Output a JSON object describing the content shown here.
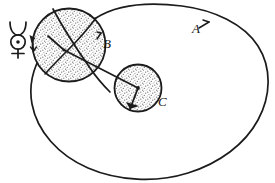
{
  "figure": {
    "background_color": "#ffffff",
    "ink_color": "#1b1b1b",
    "stipple_color": "#8a8a8a",
    "width": 275,
    "height": 183,
    "symbols": [
      {
        "id": "mercury-symbol",
        "name": "mercury-astronomical-symbol",
        "glyph": "☿",
        "x": 16,
        "y": 33,
        "description": "crescent horns above a dotted circle above a cross"
      }
    ],
    "labels": [
      {
        "id": "label-a",
        "text": "A",
        "x": 192,
        "y": 33,
        "target": "outer-oval-orbit"
      },
      {
        "id": "label-b",
        "text": "B",
        "x": 103,
        "y": 48,
        "target": "large-stippled-circle"
      },
      {
        "id": "label-c",
        "text": "C",
        "x": 158,
        "y": 106,
        "target": "small-stippled-circle"
      }
    ],
    "shapes": [
      {
        "id": "outer-oval-orbit",
        "name": "outer-oval-orbit",
        "kind": "oval",
        "label": "A",
        "cx": 150,
        "cy": 93,
        "rx": 120,
        "ry": 87,
        "filled": false
      },
      {
        "id": "large-stippled-circle",
        "name": "large-stippled-circle",
        "kind": "circle",
        "label": "B",
        "cx": 69,
        "cy": 45,
        "r": 37,
        "filled": true,
        "fill_style": "stipple"
      },
      {
        "id": "small-stippled-circle",
        "name": "small-stippled-circle",
        "kind": "circle",
        "label": "C",
        "cx": 138,
        "cy": 88,
        "r": 24,
        "filled": true,
        "fill_style": "stipple"
      }
    ],
    "connectors": [
      {
        "id": "radius-b-to-c",
        "name": "radius-line-b-to-c",
        "from": {
          "x": 65,
          "y": 50
        },
        "to": {
          "x": 138,
          "y": 88
        },
        "arrowhead": false
      },
      {
        "id": "radius-c-arrow",
        "name": "radius-arrow-in-c",
        "from": {
          "x": 138,
          "y": 88
        },
        "to": {
          "x": 129,
          "y": 110
        },
        "arrowhead": true
      },
      {
        "id": "arrow-b-left-edge",
        "name": "arrow-on-b-left-edge",
        "from": {
          "x": 31,
          "y": 36
        },
        "to": {
          "x": 33,
          "y": 50
        },
        "arrowhead": true
      }
    ],
    "tick_marks": [
      {
        "id": "tick-a",
        "name": "tick-mark-a",
        "x": 200,
        "y": 26
      },
      {
        "id": "tick-b",
        "name": "tick-mark-b",
        "x": 99,
        "y": 36
      }
    ]
  }
}
